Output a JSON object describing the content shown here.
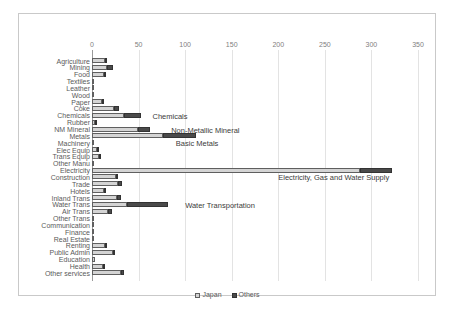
{
  "chart_data": {
    "type": "bar",
    "orientation": "horizontal",
    "stacked": true,
    "title": "",
    "xlabel": "",
    "ylabel": "",
    "xlim": [
      0,
      350
    ],
    "xticks": [
      0,
      50,
      100,
      150,
      200,
      250,
      300,
      350
    ],
    "grid": true,
    "legend_position": "bottom",
    "categories": [
      "Agriculture",
      "Mining",
      "Food",
      "Textiles",
      "Leather",
      "Wood",
      "Paper",
      "Coke",
      "Chemicals",
      "Rubber",
      "NM Mineral",
      "Metals",
      "Machinery",
      "Elec Equip",
      "Trans Equip",
      "Other Manu",
      "Electricity",
      "Construction",
      "Trade",
      "Hotels",
      "Inland Trans",
      "Water Trans",
      "Air Trans",
      "Other Trans",
      "Communication",
      "Finance",
      "Real Estate",
      "Renting",
      "Public Admin",
      "Education",
      "Health",
      "Other services"
    ],
    "series": [
      {
        "name": "Japan",
        "color": "#d4d4d4",
        "values": [
          14,
          16,
          13,
          1,
          0,
          2,
          11,
          24,
          34,
          3,
          49,
          76,
          1,
          5,
          7,
          1,
          288,
          26,
          28,
          13,
          27,
          38,
          17,
          1,
          2,
          2,
          1,
          14,
          23,
          3,
          12,
          31
        ]
      },
      {
        "name": "Others",
        "color": "#4a4a4a",
        "values": [
          1,
          7,
          1,
          0,
          0,
          0,
          1,
          5,
          19,
          1,
          13,
          36,
          0,
          1,
          1,
          0,
          34,
          2,
          4,
          1,
          4,
          44,
          4,
          0,
          0,
          0,
          0,
          1,
          1,
          0,
          1,
          3
        ]
      }
    ],
    "annotations": [
      {
        "text": "Chemicals",
        "x": 65,
        "category": "Chemicals"
      },
      {
        "text": "Non-Metallic Mineral",
        "x": 85,
        "category": "NM Mineral"
      },
      {
        "text": "Basic Metals",
        "x": 90,
        "category": "Machinery"
      },
      {
        "text": "Electricity, Gas and Water Supply",
        "x": 200,
        "category": "Construction"
      },
      {
        "text": "Water Transportation",
        "x": 100,
        "category": "Water Trans"
      }
    ]
  },
  "legend": {
    "items": [
      {
        "label": "Japan"
      },
      {
        "label": "Others"
      }
    ]
  },
  "axis": {
    "ticks": [
      "0",
      "50",
      "100",
      "150",
      "200",
      "250",
      "300",
      "350"
    ]
  }
}
